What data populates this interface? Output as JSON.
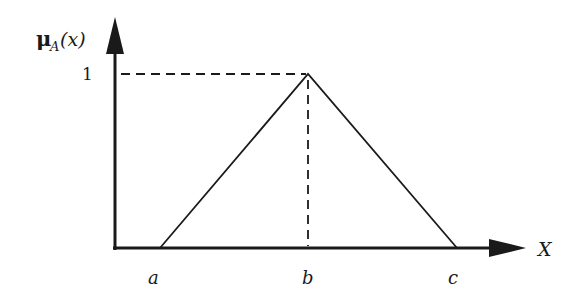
{
  "diagram": {
    "y_axis_label": {
      "mu": "μ",
      "sub": "A",
      "arg": "(x)"
    },
    "x_axis_label": "X",
    "y_tick_label": "1",
    "points": {
      "a": "a",
      "b": "b",
      "c": "c"
    },
    "colors": {
      "stroke": "#1a1a1a",
      "background": "#ffffff"
    }
  }
}
